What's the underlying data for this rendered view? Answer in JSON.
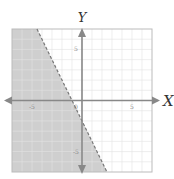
{
  "chart_data": {
    "type": "area",
    "title": "",
    "xlabel": "X",
    "ylabel": "Y",
    "xlim": [
      -7,
      7
    ],
    "ylim": [
      -7,
      7
    ],
    "grid": true,
    "grid_step": 1,
    "x_ticks": [
      {
        "value": -5,
        "label": "-5"
      },
      {
        "value": 5,
        "label": "5"
      }
    ],
    "y_ticks": [
      {
        "value": 5,
        "label": "5"
      },
      {
        "value": -5,
        "label": "-5"
      }
    ],
    "origin_label": "0",
    "boundary": {
      "slope": -2,
      "intercept": -2,
      "style": "dashed",
      "equation": "y = -2x - 2"
    },
    "inequality": "y < -2x - 2",
    "shaded_side": "below-left",
    "colors": {
      "shade": "#cfcfcf",
      "grid": "#e2e2e2",
      "axis": "#888888",
      "boundary": "#777777",
      "frame": "#bbbbbb"
    }
  }
}
